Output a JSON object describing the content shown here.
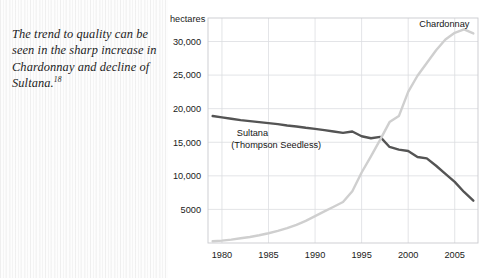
{
  "caption": {
    "text": "The trend to quality can be seen in the sharp increase in Chardonnay and decline of Sultana.",
    "footnote_marker": "18"
  },
  "chart_data": {
    "type": "line",
    "title": "",
    "xlabel": "",
    "ylabel": "hectares",
    "y_unit_label": "hectares",
    "xlim": [
      1978.5,
      2007.5
    ],
    "ylim": [
      0,
      33500
    ],
    "grid": true,
    "legend_position": "inline-annotations",
    "x_ticks": [
      1980,
      1985,
      1990,
      1995,
      2000,
      2005
    ],
    "x_tick_labels": [
      "1980",
      "1985",
      "1990",
      "1995",
      "2000",
      "2005"
    ],
    "y_ticks": [
      5000,
      10000,
      15000,
      20000,
      25000,
      30000
    ],
    "y_tick_labels": [
      "5000",
      "10,000",
      "15,000",
      "20,000",
      "25,000",
      "30,000"
    ],
    "series": [
      {
        "name": "Sultana (Thompson Seedless)",
        "label_line1": "Sultana",
        "label_line2": "(Thompson Seedless)",
        "color": "#545454",
        "stroke_width": 2.4,
        "x": [
          1979,
          1980,
          1981,
          1982,
          1983,
          1984,
          1985,
          1986,
          1987,
          1988,
          1989,
          1990,
          1991,
          1992,
          1993,
          1994,
          1995,
          1996,
          1997,
          1998,
          1999,
          2000,
          2001,
          2002,
          2003,
          2004,
          2005,
          2006,
          2007
        ],
        "values": [
          18900,
          18700,
          18500,
          18300,
          18150,
          18000,
          17850,
          17700,
          17500,
          17350,
          17150,
          17000,
          16800,
          16600,
          16400,
          16600,
          15900,
          15600,
          15800,
          14300,
          13900,
          13700,
          12800,
          12600,
          11500,
          10300,
          9100,
          7600,
          6300
        ]
      },
      {
        "name": "Chardonnay",
        "label_line1": "Chardonnay",
        "label_line2": "",
        "color": "#cfcfcf",
        "stroke_width": 2.4,
        "x": [
          1979,
          1980,
          1981,
          1982,
          1983,
          1984,
          1985,
          1986,
          1987,
          1988,
          1989,
          1990,
          1991,
          1992,
          1993,
          1994,
          1995,
          1996,
          1997,
          1998,
          1999,
          2000,
          2001,
          2002,
          2003,
          2004,
          2005,
          2006,
          2007
        ],
        "values": [
          250,
          350,
          500,
          700,
          900,
          1150,
          1450,
          1800,
          2200,
          2700,
          3300,
          4000,
          4700,
          5400,
          6100,
          7700,
          10500,
          12900,
          15400,
          18000,
          18900,
          22500,
          24900,
          26800,
          28700,
          30300,
          31300,
          31800,
          31200
        ]
      }
    ],
    "annotations": [
      {
        "text": "Chardonnay",
        "x": 2001.2,
        "y": 32200
      },
      {
        "text": "Sultana",
        "x": 1981.6,
        "y": 15900
      },
      {
        "text": "(Thompson Seedless)",
        "x": 1981.0,
        "y": 14200
      }
    ]
  }
}
